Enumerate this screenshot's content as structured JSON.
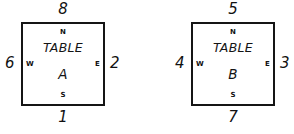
{
  "diagram": {
    "type": "two-table-compass-diagram",
    "units": [
      {
        "id": "table-a",
        "label_line1": "TABLE",
        "label_line2": "A",
        "compass": {
          "n": "N",
          "s": "S",
          "e": "E",
          "w": "W"
        },
        "edge_numbers": {
          "top": "8",
          "bottom": "1",
          "west": "6",
          "east": "2"
        }
      },
      {
        "id": "table-b",
        "label_line1": "TABLE",
        "label_line2": "B",
        "compass": {
          "n": "N",
          "s": "S",
          "e": "E",
          "w": "W"
        },
        "edge_numbers": {
          "top": "5",
          "bottom": "7",
          "west": "4",
          "east": "3"
        }
      }
    ],
    "colors": {
      "background": "#ffffff",
      "ink": "#111111",
      "border": "#151515"
    }
  }
}
